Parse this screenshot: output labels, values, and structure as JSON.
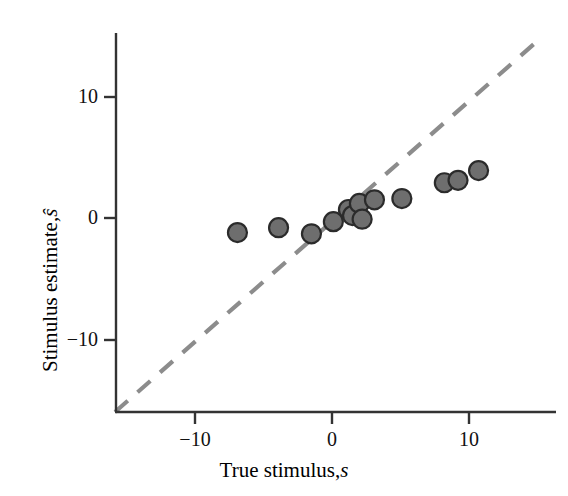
{
  "chart_data": {
    "type": "scatter",
    "title": "",
    "xlabel": "True stimulus, s",
    "ylabel": "Stimulus estimate, ŝ",
    "xlabel_main": "True stimulus,",
    "xlabel_symbol": "s",
    "ylabel_main": "Stimulus estimate,",
    "ylabel_symbol": "ŝ",
    "xlim": [
      -15,
      15
    ],
    "ylim": [
      -15,
      15
    ],
    "xticks": [
      -10,
      0,
      10
    ],
    "yticks": [
      -10,
      0,
      10
    ],
    "xtick_labels": [
      "−10",
      "0",
      "10"
    ],
    "ytick_labels": [
      "−10",
      "0",
      "10"
    ],
    "grid": false,
    "legend": null,
    "series": [
      {
        "name": "estimates",
        "marker": "circle",
        "marker_size": 19,
        "fill_color": "#6e6e6e",
        "edge_color": "#2b2b2b",
        "x": [
          -6.9,
          -3.9,
          -1.5,
          0.1,
          1.2,
          1.5,
          2.0,
          2.2,
          3.1,
          5.1,
          8.2,
          9.2,
          10.7
        ],
        "y": [
          -1.2,
          -0.8,
          -1.3,
          -0.3,
          0.7,
          0.2,
          1.2,
          -0.1,
          1.5,
          1.6,
          2.9,
          3.1,
          3.9
        ]
      }
    ],
    "reference_line": {
      "name": "unity-line",
      "style": "dashed",
      "color": "#8c8c8c",
      "x": [
        -15,
        15
      ],
      "y": [
        -15,
        15
      ],
      "description": "identity line y = x"
    },
    "axis_color": "#333333",
    "background_color": "#ffffff"
  }
}
